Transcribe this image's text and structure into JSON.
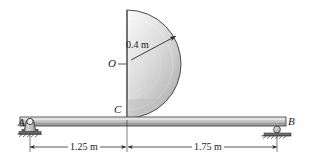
{
  "figure": {
    "type": "statics-free-body-diagram",
    "labels": {
      "support_a": "A",
      "support_b": "B",
      "contact_point": "C",
      "center": "O",
      "radius": "0.4 m"
    },
    "dimensions": [
      {
        "name": "left-span",
        "text": "1.25 m",
        "value": 1.25,
        "unit": "m"
      },
      {
        "name": "right-span",
        "text": "1.75 m",
        "value": 1.75,
        "unit": "m"
      }
    ],
    "geometry": {
      "beam": {
        "x1": 20,
        "x2": 286,
        "y_top": 117,
        "y_bottom": 126
      },
      "semicircle": {
        "cx": 127,
        "cy": 64,
        "r": 54
      },
      "pin_support": {
        "x": 30,
        "y": 122
      },
      "roller_support": {
        "x": 277,
        "y": 129
      },
      "radius_arrow": {
        "x1": 133,
        "y1": 58,
        "x2": 176,
        "y2": 36
      }
    },
    "colors": {
      "stroke": "#2b2b2b",
      "beam_light": "#e6e6e6",
      "beam_mid": "#c9c9c9",
      "beam_dark": "#9a9a9a",
      "plate_light": "#f2f2f2",
      "plate_mid": "#d6d6d6",
      "plate_dark": "#a8a8a8",
      "ground": "#4d4d4d",
      "text": "#1a1a1a"
    }
  }
}
